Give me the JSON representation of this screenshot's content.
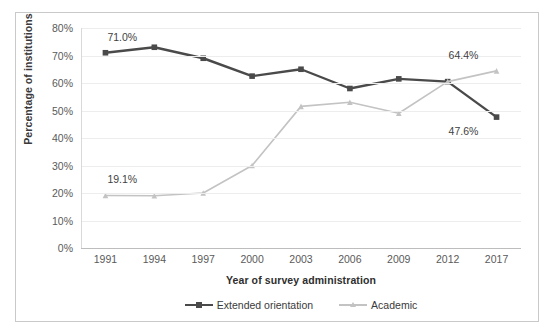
{
  "chart_data": {
    "type": "line",
    "title": "",
    "xlabel": "Year of survey administration",
    "ylabel": "Percentage of institutions",
    "categories": [
      "1991",
      "1994",
      "1997",
      "2000",
      "2003",
      "2006",
      "2009",
      "2012",
      "2017"
    ],
    "ylim": [
      0,
      80
    ],
    "yticks": [
      "0%",
      "10%",
      "20%",
      "30%",
      "40%",
      "50%",
      "60%",
      "70%",
      "80%"
    ],
    "ytick_values": [
      0,
      10,
      20,
      30,
      40,
      50,
      60,
      70,
      80
    ],
    "grid": true,
    "legend_position": "bottom",
    "series": [
      {
        "name": "Extended orientation",
        "color": "#4a4a4a",
        "marker": "square",
        "values": [
          71.0,
          73.0,
          69.0,
          62.5,
          65.0,
          58.0,
          61.5,
          60.5,
          47.6
        ]
      },
      {
        "name": "Academic",
        "color": "#c3c3c3",
        "marker": "triangle",
        "values": [
          19.1,
          19.0,
          20.0,
          30.0,
          51.5,
          53.0,
          49.0,
          60.5,
          64.4
        ]
      }
    ],
    "annotations": [
      {
        "text": "71.0%",
        "series": "Extended orientation",
        "category": "1991"
      },
      {
        "text": "19.1%",
        "series": "Academic",
        "category": "1991"
      },
      {
        "text": "64.4%",
        "series": "Academic",
        "category": "2017"
      },
      {
        "text": "47.6%",
        "series": "Extended orientation",
        "category": "2017"
      }
    ]
  }
}
